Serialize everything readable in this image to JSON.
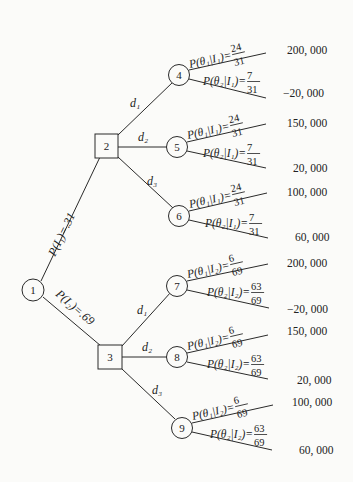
{
  "diagram": {
    "type": "decision-tree",
    "root": {
      "id": "1",
      "shape": "chance"
    },
    "branches_from_root": [
      {
        "label": "P(I₁)=.31",
        "to": "2"
      },
      {
        "label": "P(I₂)=.69",
        "to": "3"
      }
    ],
    "decision_nodes": [
      {
        "id": "2",
        "shape": "decision",
        "decisions": [
          {
            "label": "d₁",
            "to": "4"
          },
          {
            "label": "d₂",
            "to": "5"
          },
          {
            "label": "d₃",
            "to": "6"
          }
        ]
      },
      {
        "id": "3",
        "shape": "decision",
        "decisions": [
          {
            "label": "d₁",
            "to": "7"
          },
          {
            "label": "d₂",
            "to": "8"
          },
          {
            "label": "d₃",
            "to": "9"
          }
        ]
      }
    ],
    "chance_nodes": [
      {
        "id": "4",
        "p1": {
          "text": "P(θ₁|I₁)=",
          "num": "24",
          "den": "31"
        },
        "p2": {
          "text": "P(θ₂|I₁)=",
          "num": "7",
          "den": "31"
        },
        "payoff1": "200, 000",
        "payoff2": "−20, 000"
      },
      {
        "id": "5",
        "p1": {
          "text": "P(θ₁|I₁)=",
          "num": "24",
          "den": "31"
        },
        "p2": {
          "text": "P(θ₂|I₁)=",
          "num": "7",
          "den": "31"
        },
        "payoff1": "150, 000",
        "payoff2": "20, 000"
      },
      {
        "id": "6",
        "p1": {
          "text": "P(θ₁|I₁)=",
          "num": "24",
          "den": "31"
        },
        "p2": {
          "text": "P(θ₂|I₁)=",
          "num": "7",
          "den": "31"
        },
        "payoff1": "100, 000",
        "payoff2": "60, 000"
      },
      {
        "id": "7",
        "p1": {
          "text": "P(θ₁|I₂)=",
          "num": "6",
          "den": "69"
        },
        "p2": {
          "text": "P(θ₂|I₂)=",
          "num": "63",
          "den": "69"
        },
        "payoff1": "200, 000",
        "payoff2": "−20, 000"
      },
      {
        "id": "8",
        "p1": {
          "text": "P(θ₁|I₂)=",
          "num": "6",
          "den": "69"
        },
        "p2": {
          "text": "P(θ₂|I₂)=",
          "num": "63",
          "den": "69"
        },
        "payoff1": "150, 000",
        "payoff2": "20, 000"
      },
      {
        "id": "9",
        "p1": {
          "text": "P(θ₁|I₂)=",
          "num": "6",
          "den": "69"
        },
        "p2": {
          "text": "P(θ₂|I₂)=",
          "num": "63",
          "den": "69"
        },
        "payoff1": "100, 000",
        "payoff2": "60, 000"
      }
    ]
  }
}
